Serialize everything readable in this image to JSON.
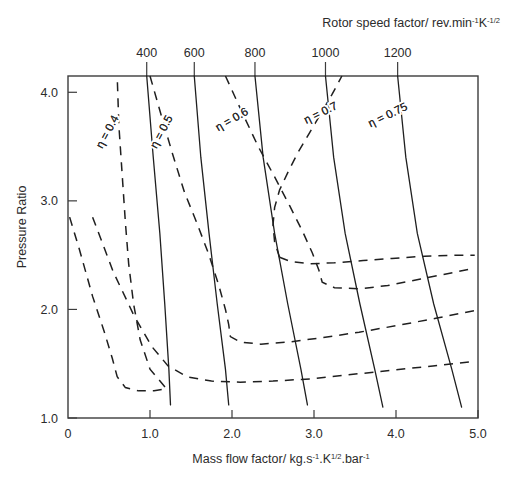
{
  "chart_data": {
    "type": "line",
    "title": "",
    "xlabel": "Mass flow factor/  kg.s-1.K1/2.bar-1",
    "ylabel": "Pressure Ratio",
    "xlim": [
      0,
      5.0
    ],
    "ylim": [
      1.0,
      4.15
    ],
    "grid": false,
    "legend": "inline-contour-labels",
    "x_ticks": [
      "0",
      "1.0",
      "2.0",
      "3.0",
      "4.0",
      "5.0"
    ],
    "x_tick_values": [
      0,
      1.0,
      2.0,
      3.0,
      4.0,
      5.0
    ],
    "y_ticks": [
      "1.0",
      "2.0",
      "3.0",
      "4.0"
    ],
    "y_tick_values": [
      1.0,
      2.0,
      3.0,
      4.0
    ],
    "top_axis_title": "Rotor speed factor/ rev.min-1K-1/2",
    "top_axis_ticks": [
      "400",
      "600",
      "800",
      "1000",
      "1200"
    ],
    "top_axis_tick_values": [
      400,
      600,
      800,
      1000,
      1200
    ],
    "speed_lines": [
      {
        "name": "400",
        "label": "400",
        "top_x": 0.96,
        "points": [
          [
            0.96,
            4.15
          ],
          [
            1.04,
            3.4
          ],
          [
            1.12,
            2.7
          ],
          [
            1.18,
            2.05
          ],
          [
            1.23,
            1.45
          ],
          [
            1.25,
            1.12
          ]
        ]
      },
      {
        "name": "600",
        "label": "600",
        "top_x": 1.54,
        "points": [
          [
            1.54,
            4.15
          ],
          [
            1.62,
            3.4
          ],
          [
            1.72,
            2.7
          ],
          [
            1.82,
            2.05
          ],
          [
            1.92,
            1.45
          ],
          [
            1.96,
            1.12
          ]
        ]
      },
      {
        "name": "800",
        "label": "800",
        "top_x": 2.28,
        "points": [
          [
            2.28,
            4.15
          ],
          [
            2.38,
            3.4
          ],
          [
            2.52,
            2.7
          ],
          [
            2.68,
            2.05
          ],
          [
            2.84,
            1.45
          ],
          [
            2.92,
            1.12
          ]
        ]
      },
      {
        "name": "1000",
        "label": "1000",
        "top_x": 3.14,
        "points": [
          [
            3.14,
            4.15
          ],
          [
            3.24,
            3.4
          ],
          [
            3.38,
            2.7
          ],
          [
            3.56,
            2.05
          ],
          [
            3.74,
            1.45
          ],
          [
            3.84,
            1.1
          ]
        ]
      },
      {
        "name": "1200",
        "label": "1200",
        "top_x": 4.02,
        "points": [
          [
            4.02,
            4.15
          ],
          [
            4.12,
            3.4
          ],
          [
            4.26,
            2.7
          ],
          [
            4.46,
            2.05
          ],
          [
            4.68,
            1.45
          ],
          [
            4.8,
            1.1
          ]
        ]
      }
    ],
    "efficiency_contours": [
      {
        "name": "eta-0.4",
        "label": "η = 0.4",
        "value": 0.4,
        "label_x": 0.52,
        "label_y": 3.62,
        "label_rotation": -62,
        "points": [
          [
            0.02,
            2.85
          ],
          [
            0.14,
            2.55
          ],
          [
            0.3,
            2.12
          ],
          [
            0.44,
            1.8
          ],
          [
            0.54,
            1.55
          ],
          [
            0.6,
            1.38
          ],
          [
            0.7,
            1.28
          ],
          [
            0.86,
            1.25
          ],
          [
            1.05,
            1.25
          ],
          [
            1.2,
            1.27
          ],
          [
            1.0,
            1.45
          ],
          [
            0.88,
            1.72
          ],
          [
            0.8,
            2.05
          ],
          [
            0.74,
            2.42
          ],
          [
            0.7,
            2.8
          ],
          [
            0.66,
            3.25
          ],
          [
            0.62,
            3.7
          ],
          [
            0.6,
            4.15
          ]
        ]
      },
      {
        "name": "eta-0.5",
        "label": "η = 0.5",
        "value": 0.5,
        "label_x": 1.18,
        "label_y": 3.62,
        "label_rotation": -62,
        "points": [
          [
            0.3,
            2.85
          ],
          [
            0.55,
            2.35
          ],
          [
            0.8,
            1.95
          ],
          [
            1.02,
            1.66
          ],
          [
            1.22,
            1.48
          ],
          [
            1.45,
            1.38
          ],
          [
            1.75,
            1.34
          ],
          [
            2.1,
            1.33
          ],
          [
            2.5,
            1.34
          ],
          [
            2.95,
            1.36
          ],
          [
            3.45,
            1.4
          ],
          [
            3.95,
            1.44
          ],
          [
            4.45,
            1.48
          ],
          [
            4.95,
            1.52
          ]
        ]
      },
      {
        "name": "eta-0.6",
        "label": "η = 0.6",
        "value": 0.6,
        "label_x": 2.02,
        "label_y": 3.72,
        "label_rotation": -30,
        "points": [
          [
            1.0,
            4.15
          ],
          [
            1.14,
            3.78
          ],
          [
            1.28,
            3.42
          ],
          [
            1.42,
            3.08
          ],
          [
            1.58,
            2.78
          ],
          [
            1.72,
            2.5
          ],
          [
            1.84,
            2.22
          ],
          [
            1.92,
            2.0
          ],
          [
            1.96,
            1.86
          ],
          [
            1.98,
            1.75
          ],
          [
            2.1,
            1.7
          ],
          [
            2.35,
            1.68
          ],
          [
            2.7,
            1.7
          ],
          [
            3.1,
            1.74
          ],
          [
            3.55,
            1.79
          ],
          [
            4.0,
            1.85
          ],
          [
            4.5,
            1.92
          ],
          [
            4.96,
            1.99
          ]
        ]
      },
      {
        "name": "eta-0.7",
        "label": "η = 0.7",
        "value": 0.7,
        "label_x": 3.1,
        "label_y": 3.78,
        "label_rotation": -26,
        "points": [
          [
            1.92,
            4.15
          ],
          [
            2.12,
            3.82
          ],
          [
            2.32,
            3.5
          ],
          [
            2.52,
            3.22
          ],
          [
            2.7,
            2.96
          ],
          [
            2.86,
            2.72
          ],
          [
            2.98,
            2.52
          ],
          [
            3.06,
            2.36
          ],
          [
            3.1,
            2.25
          ],
          [
            3.25,
            2.2
          ],
          [
            3.55,
            2.19
          ],
          [
            3.9,
            2.22
          ],
          [
            4.3,
            2.28
          ],
          [
            4.7,
            2.34
          ],
          [
            4.96,
            2.38
          ]
        ]
      },
      {
        "name": "eta-0.75",
        "label": "η = 0.75",
        "value": 0.75,
        "label_x": 3.92,
        "label_y": 3.76,
        "label_rotation": -26,
        "points": [
          [
            2.58,
            2.48
          ],
          [
            2.52,
            2.62
          ],
          [
            2.5,
            2.78
          ],
          [
            2.52,
            2.94
          ],
          [
            2.58,
            3.1
          ],
          [
            2.68,
            3.26
          ],
          [
            2.8,
            3.44
          ],
          [
            2.94,
            3.62
          ],
          [
            3.08,
            3.8
          ],
          [
            3.22,
            3.98
          ],
          [
            3.34,
            4.15
          ]
        ]
      },
      {
        "name": "eta-0.75-lower",
        "label": "",
        "value": 0.75,
        "label_x": null,
        "label_y": null,
        "label_rotation": 0,
        "points": [
          [
            2.58,
            2.48
          ],
          [
            2.72,
            2.44
          ],
          [
            2.95,
            2.42
          ],
          [
            3.25,
            2.43
          ],
          [
            3.6,
            2.45
          ],
          [
            3.95,
            2.47
          ],
          [
            4.35,
            2.49
          ],
          [
            4.75,
            2.5
          ],
          [
            4.96,
            2.5
          ]
        ]
      }
    ]
  },
  "axis_title_parts": {
    "x_main": "Mass flow factor/  kg.s",
    "x_sup1": "-1",
    "x_mid1": ".K",
    "x_sup2": "1/2",
    "x_mid2": ".bar",
    "x_sup3": "-1",
    "top_main": "Rotor speed factor/ rev.min",
    "top_sup1": "-1",
    "top_mid1": "K",
    "top_sup2": "-1/2",
    "y_main": "Pressure Ratio"
  },
  "colors": {
    "axis": "#3c3c3c",
    "speed_line": "#1f1f1f",
    "eta_line": "#1f1f1f",
    "text": "#2b2b2b",
    "background": "#ffffff"
  }
}
